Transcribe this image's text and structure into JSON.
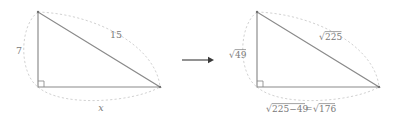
{
  "figure": {
    "arrow_glyph": "⟶",
    "colors": {
      "triangle_stroke": "#8a8a8a",
      "arc_stroke": "#c2c2c2",
      "label_text": "#7a7a7a",
      "arrow": "#3a3a3a",
      "background": "#ffffff"
    },
    "left_triangle": {
      "name": "numeric-triangle",
      "vertical_leg_label": "7",
      "hypotenuse_label": "15",
      "horizontal_leg_label": "x",
      "right_angle_marker": "square",
      "vertices": {
        "apex": [
          38,
          12
        ],
        "right_angle": [
          38,
          87
        ],
        "right": [
          160,
          87
        ]
      }
    },
    "right_triangle": {
      "name": "radical-triangle",
      "vertical_leg_label": "√49",
      "vertical_leg_radicand": "49",
      "hypotenuse_label": "√225",
      "hypotenuse_radicand": "225",
      "horizontal_leg_label": "√225−49=√176",
      "horizontal_leg_radicand_1": "225−49",
      "horizontal_leg_radicand_2": "176",
      "horizontal_leg_equals": "=",
      "right_angle_marker": "square",
      "vertices": {
        "apex": [
          257,
          12
        ],
        "right_angle": [
          257,
          87
        ],
        "right": [
          379,
          87
        ]
      }
    }
  }
}
